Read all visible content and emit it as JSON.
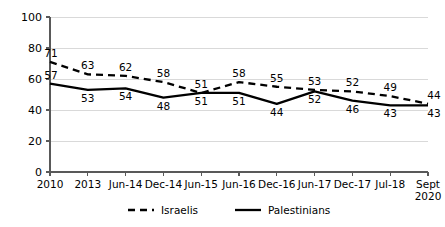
{
  "chart_data": {
    "type": "line",
    "title": "",
    "xlabel": "",
    "ylabel": "",
    "ylim": [
      0,
      100
    ],
    "yticks": [
      0,
      20,
      40,
      60,
      80,
      100
    ],
    "grid": true,
    "legend_position": "bottom",
    "categories": [
      "2010",
      "2013",
      "Jun-14",
      "Dec-14",
      "Jun-15",
      "Jun-16",
      "Dec-16",
      "Jun-17",
      "Dec-17",
      "Jul-18",
      "Sept 2020"
    ],
    "category_lines": [
      [
        "2010"
      ],
      [
        "2013"
      ],
      [
        "Jun-14"
      ],
      [
        "Dec-14"
      ],
      [
        "Jun-15"
      ],
      [
        "Jun-16"
      ],
      [
        "Dec-16"
      ],
      [
        "Jun-17"
      ],
      [
        "Dec-17"
      ],
      [
        "Jul-18"
      ],
      [
        "Sept",
        "2020"
      ]
    ],
    "series": [
      {
        "name": "Israelis",
        "style": "dashed",
        "color": "#000000",
        "values": [
          71,
          63,
          62,
          58,
          51,
          58,
          55,
          53,
          52,
          49,
          44
        ],
        "label_side": [
          "above",
          "above",
          "above",
          "above",
          "above",
          "above",
          "above",
          "above",
          "above",
          "above",
          "above"
        ]
      },
      {
        "name": "Palestinians",
        "style": "solid",
        "color": "#000000",
        "values": [
          57,
          53,
          54,
          48,
          51,
          51,
          44,
          52,
          46,
          43,
          43
        ],
        "label_side": [
          "above",
          "below",
          "below",
          "below",
          "below",
          "below",
          "below",
          "below",
          "below",
          "below",
          "below"
        ]
      }
    ],
    "legend": [
      {
        "label": "Israelis",
        "style": "dashed"
      },
      {
        "label": "Palestinians",
        "style": "solid"
      }
    ],
    "colors": {
      "gridline": "#d9d9d9",
      "axis": "#595959",
      "series": "#000000",
      "background": "#ffffff"
    }
  }
}
